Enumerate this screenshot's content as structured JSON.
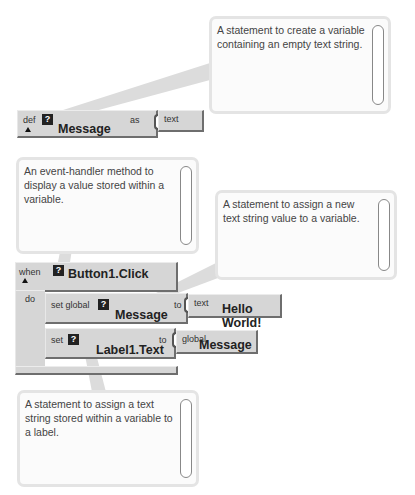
{
  "comments": [
    {
      "id": "def",
      "text": "A statement to create a variable containing an empty text string."
    },
    {
      "id": "event",
      "text": "An event-handler method to display a value stored within a variable."
    },
    {
      "id": "setglobal",
      "text": "A statement to assign a new text string value to a variable."
    },
    {
      "id": "setlabel",
      "text": "A statement to assign a text string stored within a variable to a label."
    }
  ],
  "def_block": {
    "keyword": "def",
    "badge": "?",
    "name": "Message",
    "as_label": "as",
    "value_type": "text"
  },
  "event_block": {
    "keyword": "when",
    "badge": "?",
    "event": "Button1.Click",
    "do_label": "do"
  },
  "set_global_block": {
    "keyword": "set global",
    "badge": "?",
    "name": "Message",
    "to_label": "to",
    "value_type": "text",
    "value": "Hello World!"
  },
  "set_label_block": {
    "keyword": "set",
    "badge": "?",
    "name": "Label1.Text",
    "to_label": "to",
    "value_type": "global",
    "value": "Message"
  },
  "colors": {
    "block": "#d6d6d6",
    "bubble_border": "#e4e4e4",
    "callout": "#d9d9d9"
  }
}
